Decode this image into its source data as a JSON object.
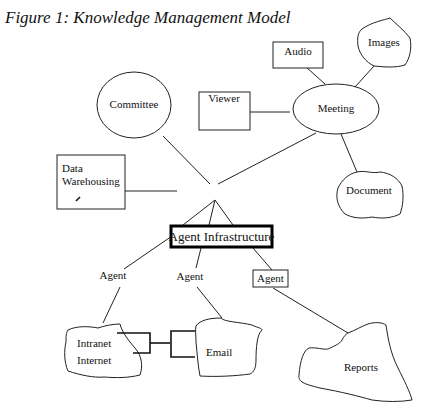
{
  "figure": {
    "title": "Figure 1: Knowledge Management Model"
  },
  "nodes": {
    "audio": "Audio",
    "images": "Images",
    "committee": "Committee",
    "viewer": "Viewer",
    "meeting": "Meeting",
    "data_warehousing_line1": "Data",
    "data_warehousing_line2": "Warehousing",
    "document": "Document",
    "agent_infrastructure": "Agent Infrastructure",
    "agent_left": "Agent",
    "agent_middle": "Agent",
    "agent_right": "Agent",
    "intranet": "Intranet",
    "internet": "Internet",
    "email": "Email",
    "reports": "Reports"
  }
}
